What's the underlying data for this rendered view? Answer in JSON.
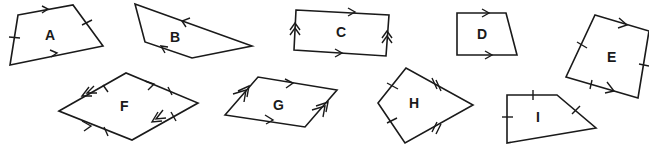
{
  "diagram": {
    "colors": {
      "stroke": "#1a1a1a",
      "background": "#ffffff"
    },
    "shapes": [
      {
        "label": "A",
        "markings": "one pair parallel sides (single arrows), one pair equal sides (single ticks)"
      },
      {
        "label": "B",
        "markings": "one pair parallel sides (single arrows)"
      },
      {
        "label": "C",
        "markings": "two pairs parallel sides (single and double arrows)"
      },
      {
        "label": "D",
        "markings": "one pair parallel sides (single arrows)"
      },
      {
        "label": "E",
        "markings": "one pair parallel sides, two pairs equal (single ticks)"
      },
      {
        "label": "F",
        "markings": "two pairs parallel (single and double arrows), all sides equal (ticks)"
      },
      {
        "label": "G",
        "markings": "two pairs parallel sides (single and double arrows)"
      },
      {
        "label": "H",
        "markings": "two pairs adjacent equal sides (single and double ticks) - kite"
      },
      {
        "label": "I",
        "markings": "three sides with single ticks"
      }
    ]
  }
}
